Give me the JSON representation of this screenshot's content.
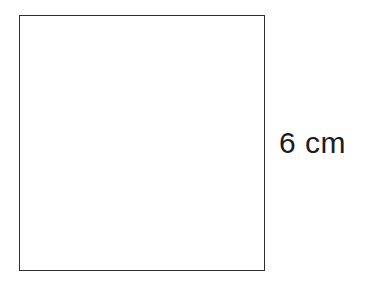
{
  "diagram": {
    "shape": "square",
    "side_label": "6 cm",
    "colors": {
      "background": "#ffffff",
      "outline": "#2e2e2e",
      "label_text": "#1c1c1c"
    }
  }
}
